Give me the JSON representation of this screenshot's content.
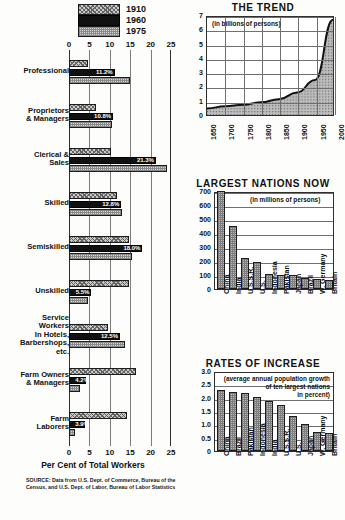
{
  "legend": {
    "items": [
      {
        "label": "1910",
        "pattern": "crosshatch"
      },
      {
        "label": "1960",
        "pattern": "solid-black"
      },
      {
        "label": "1975",
        "pattern": "stipple"
      }
    ]
  },
  "source_note": "SOURCE: Data from U.S. Dept. of Commerce, Bureau of the Census, and U.S. Dept. of Labor, Bureau of Labor Statistics",
  "chart_data": [
    {
      "type": "bar",
      "id": "occupations",
      "orientation": "horizontal",
      "title": "",
      "xlabel": "Per Cent of Total Workers",
      "ylabel": "",
      "xlim": [
        0,
        25
      ],
      "xticks": [
        0,
        5,
        10,
        15,
        20,
        25
      ],
      "grid": true,
      "legend_position": "top",
      "categories": [
        "Professional",
        "Proprietors & Managers",
        "Clerical & Sales",
        "Skilled",
        "Semiskilled",
        "Unskilled",
        "Service Workers In Hotels, Barbershops, etc.",
        "Farm Owners & Managers",
        "Farm Laborers"
      ],
      "category_lines": [
        [
          "Professional"
        ],
        [
          "Proprietors",
          "& Managers"
        ],
        [
          "Clerical &",
          "Sales"
        ],
        [
          "Skilled"
        ],
        [
          "Semiskilled"
        ],
        [
          "Unskilled"
        ],
        [
          "Service",
          "Workers",
          "In Hotels,",
          "Barbershops,",
          "etc."
        ],
        [
          "Farm Owners",
          "& Managers"
        ],
        [
          "Farm",
          "Laborers"
        ]
      ],
      "series": [
        {
          "name": "1910",
          "values": [
            4.7,
            6.6,
            10.2,
            11.7,
            14.7,
            14.7,
            9.6,
            16.5,
            14.3
          ]
        },
        {
          "name": "1960",
          "values": [
            11.2,
            10.8,
            21.3,
            12.8,
            18.0,
            5.5,
            12.5,
            4.2,
            3.9
          ]
        },
        {
          "name": "1975",
          "values": [
            15.0,
            10.5,
            24.0,
            12.9,
            15.5,
            4.7,
            13.7,
            2.7,
            1.4
          ]
        }
      ],
      "value_labels": {
        "1960": [
          "11.2%",
          "10.8%",
          "21.3%",
          "12.8%",
          "18.0%",
          "5.5%",
          "12.5%",
          "4.2%",
          "3.9%"
        ]
      }
    },
    {
      "type": "area",
      "id": "the-trend",
      "title": "THE TREND",
      "subtitle": "(in billions of persons)",
      "xlabel": "",
      "ylabel": "",
      "ylim": [
        0,
        7
      ],
      "yticks": [
        0,
        1,
        2,
        3,
        4,
        5,
        6,
        7
      ],
      "xticks": [
        "1650",
        "1700",
        "1750",
        "1800",
        "1850",
        "1900",
        "1950",
        "2000"
      ],
      "grid": true,
      "x": [
        1650,
        1700,
        1750,
        1800,
        1850,
        1900,
        1950,
        2000
      ],
      "values": [
        0.47,
        0.62,
        0.73,
        0.9,
        1.13,
        1.6,
        2.5,
        6.8
      ]
    },
    {
      "type": "bar",
      "id": "largest-nations-now",
      "title": "LARGEST NATIONS NOW",
      "subtitle": "(in millions of persons)",
      "xlabel": "",
      "ylabel": "",
      "ylim": [
        0,
        700
      ],
      "yticks": [
        0,
        100,
        200,
        300,
        400,
        500,
        600,
        700
      ],
      "grid": true,
      "categories": [
        "China",
        "India",
        "U.S.S.R.",
        "U.S.",
        "Indonesia",
        "Pakistan",
        "Japan",
        "Brazil",
        "W. Germany",
        "Britain"
      ],
      "values": [
        710,
        450,
        220,
        196,
        105,
        103,
        100,
        82,
        72,
        62
      ]
    },
    {
      "type": "bar",
      "id": "rates-of-increase",
      "title": "RATES OF INCREASE",
      "subtitle_lines": [
        "(average annual population growth",
        "of ten largest nations",
        "in percent)"
      ],
      "xlabel": "",
      "ylabel": "",
      "ylim": [
        0,
        3.0
      ],
      "yticks": [
        "0",
        "0.5",
        "1.0",
        "1.5",
        "2.0",
        "2.5",
        "3.0"
      ],
      "grid": true,
      "categories": [
        "China",
        "Brazil",
        "Pakistan",
        "Indonesia",
        "India",
        "U.S.S.R.",
        "U.S.",
        "Japan",
        "W. Germany",
        "Britain"
      ],
      "values": [
        2.3,
        2.21,
        2.16,
        2.02,
        1.89,
        1.72,
        1.32,
        1.03,
        0.72,
        0.66
      ]
    }
  ]
}
